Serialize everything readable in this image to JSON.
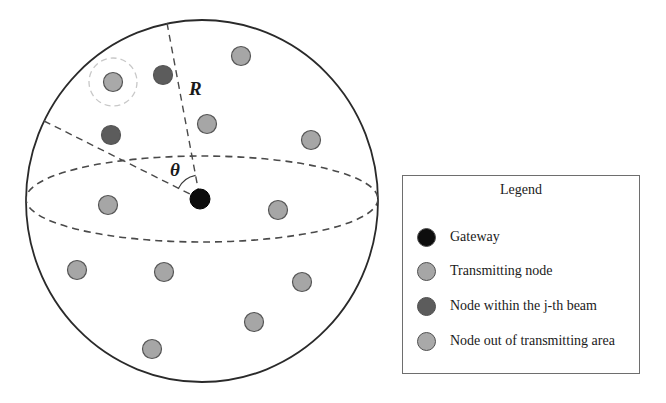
{
  "figure": {
    "sphere": {
      "cx": 202,
      "cy": 201,
      "rx": 176,
      "ry": 181,
      "stroke": "#2a2a2a"
    },
    "equator": {
      "cx": 202,
      "cy": 199,
      "rx": 176,
      "ry": 43,
      "stroke": "#4a4a4a"
    },
    "gateway": {
      "x": 200,
      "y": 199,
      "r": 10
    },
    "radius_line": {
      "x1": 167,
      "y1": 23,
      "x2": 200,
      "y2": 199
    },
    "beam_edge_line": {
      "x1": 44,
      "y1": 121,
      "x2": 200,
      "y2": 199
    },
    "labels": {
      "radius": "R",
      "angle": "θ"
    },
    "nodes": {
      "transmitting": [
        {
          "x": 241,
          "y": 56
        },
        {
          "x": 207,
          "y": 124
        },
        {
          "x": 311,
          "y": 140
        },
        {
          "x": 108,
          "y": 205
        },
        {
          "x": 278,
          "y": 210
        },
        {
          "x": 77,
          "y": 270
        },
        {
          "x": 164,
          "y": 272
        },
        {
          "x": 302,
          "y": 282
        },
        {
          "x": 254,
          "y": 322
        },
        {
          "x": 152,
          "y": 349
        }
      ],
      "within_beam": [
        {
          "x": 163,
          "y": 75
        },
        {
          "x": 111,
          "y": 135
        }
      ],
      "out_of_area": [
        {
          "x": 113,
          "y": 82,
          "halo_r": 24
        }
      ]
    }
  },
  "legend": {
    "title": "Legend",
    "items": [
      {
        "label": "Gateway",
        "color": "#0d0d0d",
        "icon": "gateway-dot-icon"
      },
      {
        "label": "Transmitting node",
        "color": "#a6a6a6",
        "icon": "transmitting-node-dot-icon"
      },
      {
        "label": "Node within the j-th beam",
        "color": "#5c5c5c",
        "icon": "beam-node-dot-icon"
      },
      {
        "label": "Node out of transmitting area",
        "color": "#a9a9a9",
        "icon": "out-of-area-node-dot-icon"
      }
    ]
  },
  "colors": {
    "gateway": "#0d0d0d",
    "transmitting": "#a6a6a6",
    "within_beam": "#5c5c5c",
    "out_of_area": "#a9a9a9",
    "node_stroke": "#555555",
    "halo": "#c8c8c8",
    "dash": "#4a4a4a"
  }
}
